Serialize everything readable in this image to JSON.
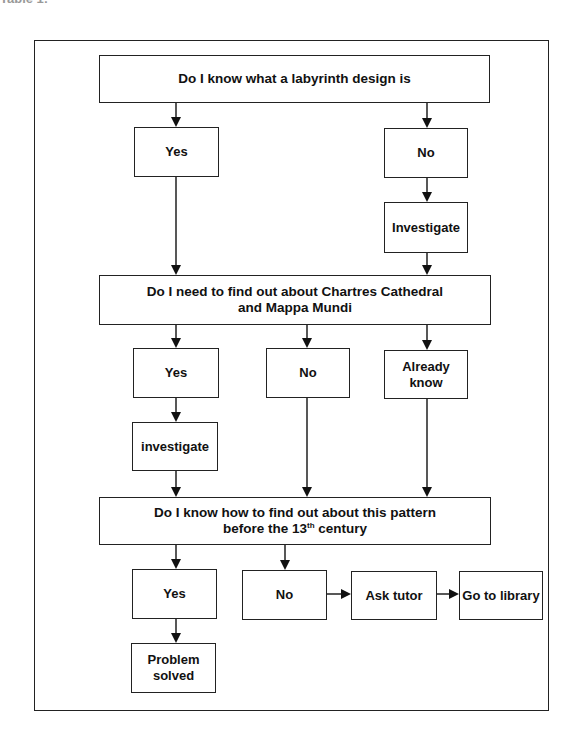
{
  "page": {
    "header_fragment": "Table 1:"
  },
  "nodes": {
    "q1": {
      "label": "Do I know what a labyrinth design is"
    },
    "q1_yes": {
      "label": "Yes"
    },
    "q1_no": {
      "label": "No"
    },
    "q1_investigate": {
      "label": "Investigate"
    },
    "q2": {
      "label": "Do I need to find out about Chartres Cathedral and Mappa Mundi"
    },
    "q2_yes": {
      "label": "Yes"
    },
    "q2_no": {
      "label": "No"
    },
    "q2_already": {
      "label": "Already know"
    },
    "q2_investigate": {
      "label": "investigate"
    },
    "q3": {
      "label_before": "Do I know how to find out about this pattern before the 13",
      "label_sup": "th",
      "label_after": " century"
    },
    "q3_yes": {
      "label": "Yes"
    },
    "q3_no": {
      "label": "No"
    },
    "q3_ask": {
      "label": "Ask tutor"
    },
    "q3_library": {
      "label": "Go to library"
    },
    "q3_solved": {
      "label": "Problem solved"
    }
  },
  "edges": [
    [
      "q1",
      "q1_yes"
    ],
    [
      "q1",
      "q1_no"
    ],
    [
      "q1_no",
      "q1_investigate"
    ],
    [
      "q1_yes",
      "q2"
    ],
    [
      "q1_investigate",
      "q2"
    ],
    [
      "q2",
      "q2_yes"
    ],
    [
      "q2",
      "q2_no"
    ],
    [
      "q2",
      "q2_already"
    ],
    [
      "q2_yes",
      "q2_investigate"
    ],
    [
      "q2_investigate",
      "q3"
    ],
    [
      "q2_no",
      "q3"
    ],
    [
      "q2_already",
      "q3"
    ],
    [
      "q3",
      "q3_yes"
    ],
    [
      "q3",
      "q3_no"
    ],
    [
      "q3_yes",
      "q3_solved"
    ],
    [
      "q3_no",
      "q3_ask"
    ],
    [
      "q3_ask",
      "q3_library"
    ]
  ]
}
